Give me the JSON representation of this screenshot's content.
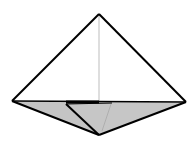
{
  "diagram": {
    "type": "origami-fold-diagram",
    "colors": {
      "background": "#ffffff",
      "paper_front": "#ffffff",
      "paper_back": "#c4c4c4",
      "outline": "#000000",
      "crease": "#bdbdbd"
    },
    "points": {
      "top": [
        99,
        14
      ],
      "left": [
        12,
        101
      ],
      "right": [
        186,
        102
      ],
      "bottom": [
        99,
        135
      ],
      "flap_start": [
        66,
        104
      ],
      "center": [
        99,
        101
      ]
    }
  }
}
